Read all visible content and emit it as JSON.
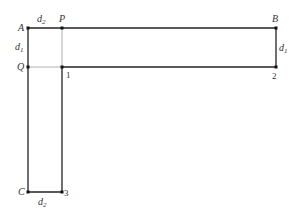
{
  "diagram": {
    "points": {
      "A": {
        "label": "A",
        "x": 28,
        "y": 28
      },
      "P": {
        "label": "P",
        "x": 62,
        "y": 28
      },
      "B": {
        "label": "B",
        "x": 276,
        "y": 28
      },
      "Q": {
        "label": "Q",
        "x": 28,
        "y": 67
      },
      "one": {
        "label": "1",
        "x": 62,
        "y": 67
      },
      "two": {
        "label": "2",
        "x": 276,
        "y": 67
      },
      "C": {
        "label": "C",
        "x": 28,
        "y": 192
      },
      "three": {
        "label": "3",
        "x": 62,
        "y": 192
      }
    },
    "dimensions": {
      "d2_top": {
        "base": "d",
        "sub": "2"
      },
      "d1_left": {
        "base": "d",
        "sub": "1"
      },
      "d1_right": {
        "base": "d",
        "sub": "1"
      },
      "d2_bottom": {
        "base": "d",
        "sub": "2"
      }
    },
    "colors": {
      "thick_line": "#222222",
      "thin_line": "#aaaaaa",
      "text": "#333333"
    }
  }
}
